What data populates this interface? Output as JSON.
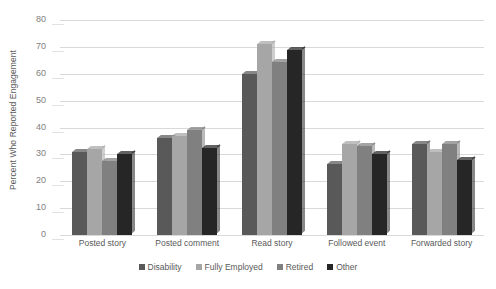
{
  "chart_data": {
    "type": "bar",
    "title": "",
    "xlabel": "",
    "ylabel": "Percent Who Reported Engagement",
    "ylim": [
      0,
      80
    ],
    "ytick_step": 10,
    "yticks": [
      80,
      70,
      60,
      50,
      40,
      30,
      20,
      10,
      0
    ],
    "grid": true,
    "legend_position": "bottom",
    "categories": [
      "Posted story",
      "Posted comment",
      "Read story",
      "Followed event",
      "Forwarded story"
    ],
    "series": [
      {
        "name": "Disability",
        "color": "#595959",
        "values": [
          31,
          36,
          60,
          26.5,
          34
        ]
      },
      {
        "name": "Fully Employed",
        "color": "#a6a6a6",
        "values": [
          32,
          37,
          71,
          34,
          31
        ]
      },
      {
        "name": "Retired",
        "color": "#808080",
        "values": [
          27.5,
          39,
          64.5,
          33,
          34
        ]
      },
      {
        "name": "Other",
        "color": "#262626",
        "values": [
          30,
          32.5,
          69,
          30,
          28
        ]
      }
    ]
  }
}
